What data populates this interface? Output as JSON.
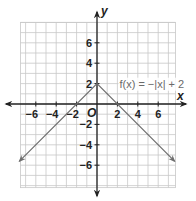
{
  "chart_data": {
    "type": "line",
    "title": "",
    "xlabel": "x",
    "ylabel": "y",
    "xlim": [
      -7.5,
      7.7
    ],
    "ylim": [
      -8.2,
      8
    ],
    "grid": true,
    "x_ticks": [
      -6,
      -4,
      -2,
      2,
      4,
      6
    ],
    "y_ticks": [
      6,
      4,
      2,
      -2,
      -4,
      -6
    ],
    "origin_label": "O",
    "series": [
      {
        "name": "f(x) = −|x| + 2",
        "equation": "f(x) = -|x| + 2",
        "points": [
          [
            -7.6,
            -5.6
          ],
          [
            0,
            2
          ],
          [
            7.6,
            -5.6
          ]
        ],
        "arrows_at_ends": true
      }
    ],
    "annotations": [
      {
        "text": "f(x) = −|x| + 2",
        "x": 2.2,
        "y": 1.6
      }
    ]
  },
  "labels": {
    "x_axis": "x",
    "y_axis": "y",
    "origin": "O",
    "function_label": "f(x) = −|x| + 2"
  },
  "colors": {
    "grid": "#c8c8c8",
    "grid_major": "#b0b0b0",
    "axis": "#222222",
    "line": "#6e6e6e",
    "label": "#6a6a6a"
  }
}
